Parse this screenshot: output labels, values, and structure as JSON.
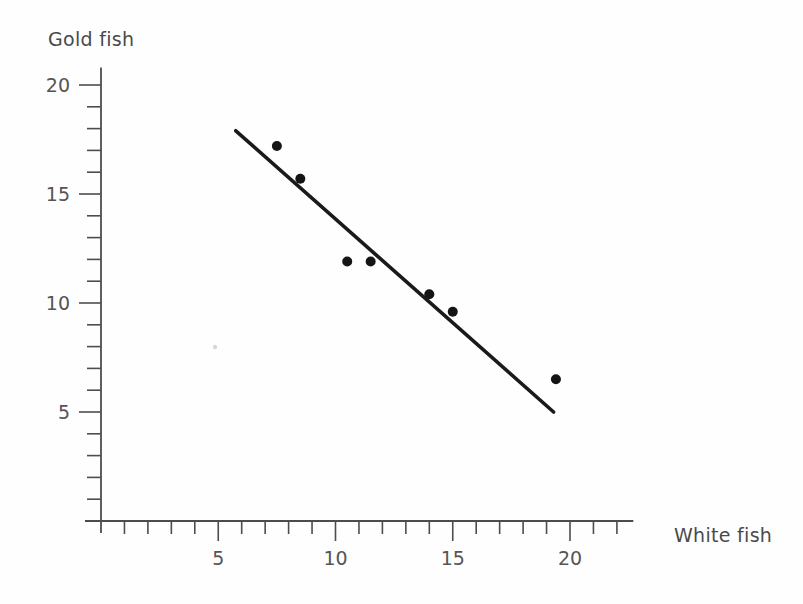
{
  "chart_data": {
    "type": "scatter",
    "title": "",
    "xlabel": "White fish",
    "ylabel": "Gold fish",
    "xlim": [
      0,
      22.7
    ],
    "ylim": [
      0,
      20.8
    ],
    "grid": false,
    "legend": "none",
    "x_ticks_major": [
      5,
      10,
      15,
      20
    ],
    "x_tick_labels": [
      "5",
      "10",
      "15",
      "20"
    ],
    "x_ticks_minor_step": 1,
    "y_ticks_major": [
      5,
      10,
      15,
      20
    ],
    "y_tick_labels": [
      "5",
      "10",
      "15",
      "20"
    ],
    "y_ticks_minor_step": 1,
    "points": [
      {
        "x": 7.5,
        "y": 17.2
      },
      {
        "x": 8.5,
        "y": 15.7
      },
      {
        "x": 10.5,
        "y": 11.9
      },
      {
        "x": 11.5,
        "y": 11.9
      },
      {
        "x": 14.0,
        "y": 10.4
      },
      {
        "x": 15.0,
        "y": 9.6
      },
      {
        "x": 19.4,
        "y": 6.5
      }
    ],
    "point_color": "#141414",
    "point_radius": 5,
    "trend_line": {
      "x_start": 5.75,
      "y_start": 17.9,
      "x_end": 19.3,
      "y_end": 5.0,
      "color": "#1a1a1a",
      "width": 3.6
    },
    "axis_color": "#4d4d4d",
    "background_color": "#fefefe"
  },
  "labels": {
    "y_axis_title": "Gold fish",
    "x_axis_title": "White fish"
  }
}
